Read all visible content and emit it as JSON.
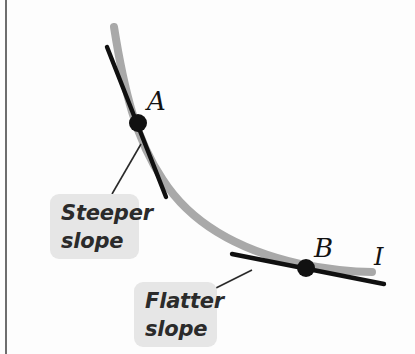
{
  "figure": {
    "background_color": "#fdfdfd",
    "width": 415,
    "height": 354
  },
  "curve": {
    "name": "indifference-curve",
    "label": "I",
    "color": "#a9a9a9",
    "stroke_width": 8,
    "shape": "convex-to-origin",
    "path_points": [
      [
        114,
        27
      ],
      [
        131,
        95
      ],
      [
        152,
        152
      ],
      [
        178,
        196
      ],
      [
        213,
        231
      ],
      [
        258,
        253
      ],
      [
        312,
        266
      ],
      [
        372,
        272
      ]
    ]
  },
  "points": [
    {
      "name": "point-a",
      "label": "A",
      "x": 138,
      "y": 123,
      "radius": 9,
      "color": "#111111",
      "label_x": 147,
      "label_y": 88
    },
    {
      "name": "point-b",
      "label": "B",
      "x": 306,
      "y": 268,
      "radius": 9,
      "color": "#111111",
      "label_x": 314,
      "label_y": 235
    }
  ],
  "tangents": [
    {
      "name": "tangent-at-a",
      "description": "Steeper tangent line at point A",
      "x1": 107,
      "y1": 47,
      "x2": 166,
      "y2": 197,
      "color": "#101010",
      "stroke_width": 4
    },
    {
      "name": "tangent-at-b",
      "description": "Flatter tangent line at point B",
      "x1": 232,
      "y1": 254,
      "x2": 384,
      "y2": 284,
      "color": "#101010",
      "stroke_width": 4
    }
  ],
  "callouts": [
    {
      "name": "callout-steeper",
      "text": "Steeper\nslope",
      "line1": "Steeper",
      "line2": "slope",
      "box_color": "#e6e6e6",
      "text_color": "#2b2b2b",
      "leader": {
        "x1": 112,
        "y1": 194,
        "x2": 141,
        "y2": 144
      }
    },
    {
      "name": "callout-flatter",
      "text": "Flatter\nslope",
      "line1": "Flatter",
      "line2": "slope",
      "box_color": "#e6e6e6",
      "text_color": "#2b2b2b",
      "leader": {
        "x1": 214,
        "y1": 289,
        "x2": 252,
        "y2": 270
      }
    }
  ],
  "axis_rule": {
    "name": "left-rule",
    "color": "#6e6e6e"
  }
}
